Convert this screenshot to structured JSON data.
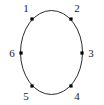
{
  "figure": {
    "kind": "cycle-graph-diagram",
    "background_color": "#ffffff",
    "stroke_color": "#2b2b2b",
    "label_color": "#1a1a1a",
    "vertex_color": "#000000"
  },
  "circle": {
    "center_x": 51.5,
    "center_y": 52.5,
    "radius_x": 31,
    "radius_y": 42,
    "stroke_width": 1
  },
  "vertices": [
    {
      "label": "1",
      "dot_x": 32,
      "dot_y": 19,
      "label_x": 26,
      "label_y": 9,
      "anchor": "middle"
    },
    {
      "label": "2",
      "dot_x": 71,
      "dot_y": 19,
      "label_x": 77,
      "label_y": 9,
      "anchor": "middle"
    },
    {
      "label": "3",
      "dot_x": 82,
      "dot_y": 53,
      "label_x": 91,
      "label_y": 54,
      "anchor": "middle"
    },
    {
      "label": "4",
      "dot_x": 71,
      "dot_y": 86,
      "label_x": 77,
      "label_y": 97,
      "anchor": "middle"
    },
    {
      "label": "5",
      "dot_x": 32,
      "dot_y": 86,
      "label_x": 26,
      "label_y": 97,
      "anchor": "middle"
    },
    {
      "label": "6",
      "dot_x": 21,
      "dot_y": 53,
      "label_x": 12,
      "label_y": 54,
      "anchor": "middle"
    }
  ]
}
